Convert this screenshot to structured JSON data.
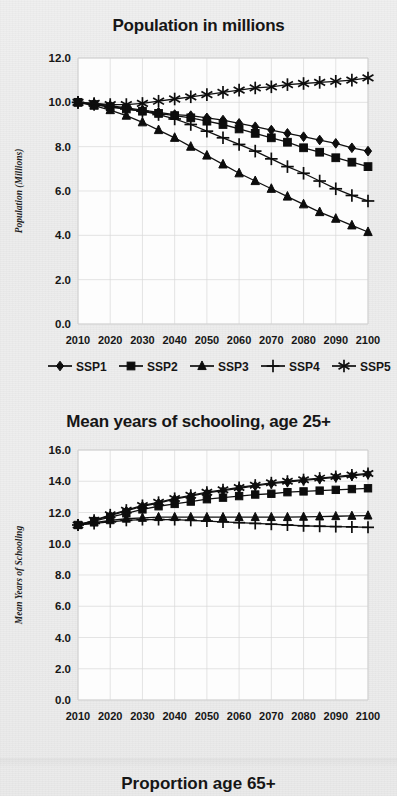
{
  "page": {
    "background_color": "#eeeeee",
    "ink_color": "#111111",
    "plot_background": "#fdfdfd",
    "gridline_color": "#d9d9d9"
  },
  "charts": [
    {
      "id": "population",
      "title": "Population in millions",
      "ylabel": "Population (Millions)",
      "legend": [
        {
          "label": "SSP1",
          "marker": "diamond"
        },
        {
          "label": "SSP2",
          "marker": "square"
        },
        {
          "label": "SSP3",
          "marker": "triangle"
        },
        {
          "label": "SSP4",
          "marker": "plus"
        },
        {
          "label": "SSP5",
          "marker": "asterisk"
        }
      ]
    },
    {
      "id": "schooling",
      "title": "Mean years of schooling, age 25+",
      "ylabel": "Mean Years of Schooling",
      "legend": []
    },
    {
      "id": "proportion65",
      "title": "Proportion age 65+",
      "ylabel": "",
      "legend": []
    }
  ],
  "chart_data": [
    {
      "type": "line",
      "title": "Population in millions",
      "xlabel": "",
      "ylabel": "Population (Millions)",
      "x": [
        2010,
        2015,
        2020,
        2025,
        2030,
        2035,
        2040,
        2045,
        2050,
        2055,
        2060,
        2065,
        2070,
        2075,
        2080,
        2085,
        2090,
        2095,
        2100
      ],
      "xticks": [
        "2010",
        "2020",
        "2030",
        "2040",
        "2050",
        "2060",
        "2070",
        "2080",
        "2090",
        "2100"
      ],
      "yticks": [
        "0.0",
        "2.0",
        "4.0",
        "6.0",
        "8.0",
        "10.0",
        "12.0"
      ],
      "xlim": [
        2010,
        2100
      ],
      "ylim": [
        0.0,
        12.0
      ],
      "grid": true,
      "legend_position": "below",
      "series": [
        {
          "name": "SSP1",
          "marker": "diamond",
          "values": [
            10.0,
            9.95,
            9.85,
            9.75,
            9.65,
            9.55,
            9.45,
            9.4,
            9.3,
            9.2,
            9.05,
            8.9,
            8.75,
            8.6,
            8.45,
            8.3,
            8.15,
            7.95,
            7.8
          ]
        },
        {
          "name": "SSP2",
          "marker": "square",
          "values": [
            10.0,
            9.9,
            9.8,
            9.7,
            9.6,
            9.5,
            9.4,
            9.3,
            9.15,
            9.0,
            8.8,
            8.6,
            8.4,
            8.2,
            7.95,
            7.75,
            7.5,
            7.3,
            7.1
          ]
        },
        {
          "name": "SSP3",
          "marker": "triangle",
          "values": [
            10.0,
            9.85,
            9.65,
            9.4,
            9.1,
            8.75,
            8.4,
            8.0,
            7.6,
            7.2,
            6.8,
            6.45,
            6.1,
            5.75,
            5.4,
            5.05,
            4.75,
            4.45,
            4.15
          ]
        },
        {
          "name": "SSP4",
          "marker": "plus",
          "values": [
            10.0,
            9.9,
            9.8,
            9.7,
            9.6,
            9.45,
            9.25,
            9.0,
            8.7,
            8.4,
            8.1,
            7.8,
            7.45,
            7.1,
            6.8,
            6.45,
            6.1,
            5.8,
            5.55
          ]
        },
        {
          "name": "SSP5",
          "marker": "asterisk",
          "values": [
            10.0,
            9.95,
            9.9,
            9.9,
            9.95,
            10.05,
            10.15,
            10.25,
            10.35,
            10.45,
            10.55,
            10.65,
            10.7,
            10.8,
            10.85,
            10.9,
            10.95,
            11.0,
            11.1
          ]
        }
      ]
    },
    {
      "type": "line",
      "title": "Mean years of schooling, age 25+",
      "xlabel": "",
      "ylabel": "Mean Years of Schooling",
      "x": [
        2010,
        2015,
        2020,
        2025,
        2030,
        2035,
        2040,
        2045,
        2050,
        2055,
        2060,
        2065,
        2070,
        2075,
        2080,
        2085,
        2090,
        2095,
        2100
      ],
      "xticks": [
        "2010",
        "2020",
        "2030",
        "2040",
        "2050",
        "2060",
        "2070",
        "2080",
        "2090",
        "2100"
      ],
      "yticks": [
        "0.0",
        "2.0",
        "4.0",
        "6.0",
        "8.0",
        "10.0",
        "12.0",
        "14.0",
        "16.0"
      ],
      "xlim": [
        2010,
        2100
      ],
      "ylim": [
        0.0,
        16.0
      ],
      "grid": true,
      "legend_position": "none",
      "series": [
        {
          "name": "SSP1",
          "marker": "diamond",
          "values": [
            11.2,
            11.5,
            11.8,
            12.1,
            12.4,
            12.6,
            12.85,
            13.05,
            13.25,
            13.4,
            13.55,
            13.7,
            13.85,
            13.95,
            14.05,
            14.15,
            14.25,
            14.35,
            14.45
          ]
        },
        {
          "name": "SSP2",
          "marker": "square",
          "values": [
            11.2,
            11.45,
            11.7,
            11.95,
            12.2,
            12.4,
            12.55,
            12.7,
            12.85,
            12.95,
            13.05,
            13.15,
            13.2,
            13.3,
            13.35,
            13.4,
            13.45,
            13.5,
            13.55
          ]
        },
        {
          "name": "SSP3",
          "marker": "triangle",
          "values": [
            11.2,
            11.35,
            11.5,
            11.6,
            11.65,
            11.7,
            11.7,
            11.7,
            11.7,
            11.7,
            11.7,
            11.7,
            11.7,
            11.7,
            11.72,
            11.74,
            11.76,
            11.78,
            11.8
          ]
        },
        {
          "name": "SSP4",
          "marker": "plus",
          "values": [
            11.2,
            11.3,
            11.4,
            11.5,
            11.55,
            11.55,
            11.55,
            11.5,
            11.45,
            11.4,
            11.35,
            11.3,
            11.25,
            11.2,
            11.15,
            11.12,
            11.1,
            11.08,
            11.05
          ]
        },
        {
          "name": "SSP5",
          "marker": "asterisk",
          "values": [
            11.2,
            11.5,
            11.85,
            12.15,
            12.45,
            12.65,
            12.9,
            13.1,
            13.3,
            13.45,
            13.6,
            13.75,
            13.9,
            14.0,
            14.1,
            14.2,
            14.3,
            14.4,
            14.5
          ]
        }
      ]
    }
  ]
}
